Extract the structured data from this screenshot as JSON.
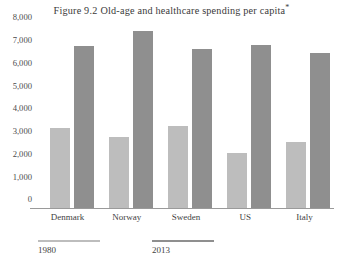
{
  "figure": {
    "number": "Figure 9.2",
    "title": "Old-age and healthcare spending per capita",
    "footnote_marker": "*"
  },
  "legend": {
    "position": "bottom-left",
    "items": [
      {
        "label": "1980",
        "color": "#bdbdbd"
      },
      {
        "label": "2013",
        "color": "#8f8f8f"
      }
    ]
  },
  "axis": {
    "y_ticks": [
      "8,000",
      "7,000",
      "6,000",
      "5,000",
      "4,000",
      "3,000",
      "2,000",
      "1,000",
      "0"
    ],
    "y_tick_values": [
      8000,
      7000,
      6000,
      5000,
      4000,
      3000,
      2000,
      1000,
      0
    ]
  },
  "chart_data": {
    "type": "bar",
    "xlabel": "",
    "ylabel": "",
    "ylim": [
      0,
      8000
    ],
    "ytick_step": 1000,
    "grid": false,
    "legend_position": "bottom-left",
    "categories": [
      "Denmark",
      "Norway",
      "Sweden",
      "US",
      "Italy"
    ],
    "series": [
      {
        "name": "1980",
        "color": "#bdbdbd",
        "values": [
          3500,
          3100,
          3600,
          2400,
          2900
        ]
      },
      {
        "name": "2013",
        "color": "#8f8f8f",
        "values": [
          7100,
          7800,
          7000,
          7150,
          6800
        ]
      }
    ]
  }
}
